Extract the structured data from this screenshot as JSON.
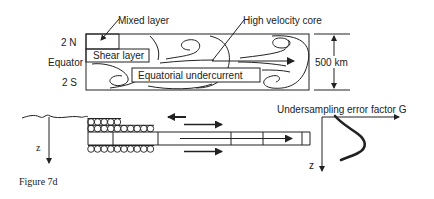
{
  "top_panel": {
    "labels": {
      "mixed_layer": "Mixed layer",
      "high_velocity_core": "High velocity core",
      "lat_north": "2 N",
      "equator": "Equator",
      "lat_south": "2 S",
      "shear_layer": "Shear layer",
      "equatorial_undercurrent": "Equatorial undercurrent",
      "width_scale": "500  km"
    }
  },
  "bottom_panel": {
    "depth_axis_left": "z",
    "depth_axis_right": "z",
    "x_axis_label": "Undersampling  error  factor  G",
    "caption": "Figure  7d"
  },
  "colors": {
    "ink": "#222222",
    "background": "#ffffff"
  }
}
